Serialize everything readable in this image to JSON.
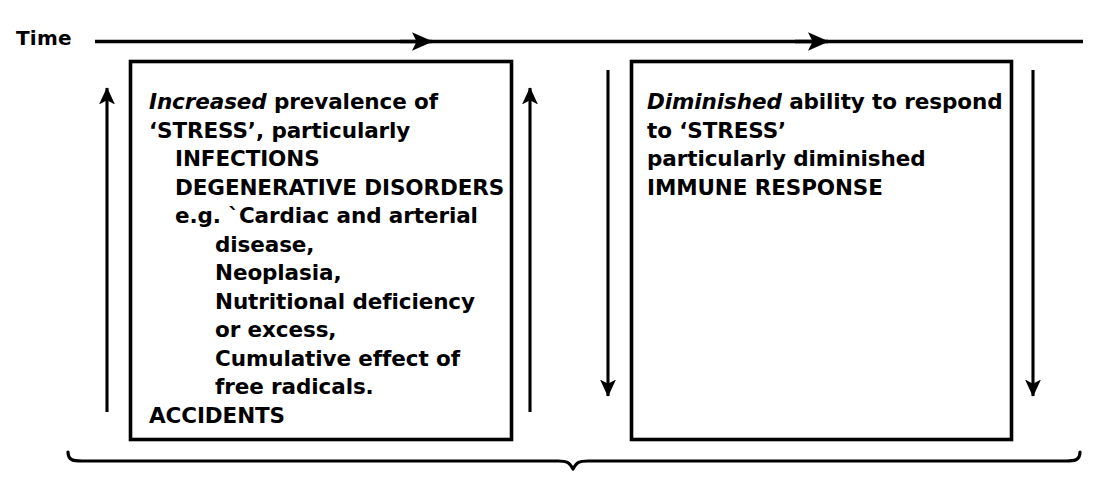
{
  "meta": {
    "diagram_type": "process-flow",
    "width": 1105,
    "height": 478,
    "background_color": "#ffffff",
    "ink_color": "#000000"
  },
  "axis": {
    "label": "Time",
    "direction": "left-to-right",
    "arrowheads": 2
  },
  "boxes": [
    {
      "id": "left-box",
      "lines": [
        {
          "text_italic": "Increased",
          "text": " prevalence of",
          "indent": 0
        },
        {
          "text_italic": "",
          "text": "‘STRESS’, particularly",
          "indent": 0
        },
        {
          "text_italic": "",
          "text": "INFECTIONS",
          "indent": 1
        },
        {
          "text_italic": "",
          "text": "DEGENERATIVE DISORDERS",
          "indent": 1
        },
        {
          "text_italic": "",
          "text": "e.g. `Cardiac and arterial",
          "indent": 1
        },
        {
          "text_italic": "",
          "text": "disease,",
          "indent": 2
        },
        {
          "text_italic": "",
          "text": "Neoplasia,",
          "indent": 2
        },
        {
          "text_italic": "",
          "text": "Nutritional deficiency",
          "indent": 2
        },
        {
          "text_italic": "",
          "text": "or excess,",
          "indent": 2
        },
        {
          "text_italic": "",
          "text": "Cumulative effect of",
          "indent": 2
        },
        {
          "text_italic": "",
          "text": "free radicals.",
          "indent": 2
        },
        {
          "text_italic": "",
          "text": "ACCIDENTS",
          "indent": 0
        }
      ]
    },
    {
      "id": "right-box",
      "lines": [
        {
          "text_italic": "Diminished",
          "text": " ability to respond",
          "indent": 0
        },
        {
          "text_italic": "",
          "text": "to ‘STRESS’",
          "indent": 0
        },
        {
          "text_italic": "",
          "text": "particularly diminished",
          "indent": 0
        },
        {
          "text_italic": "",
          "text": "IMMUNE RESPONSE",
          "indent": 0
        }
      ]
    }
  ],
  "vertical_arrows": [
    {
      "id": "arrow-left-outer",
      "direction": "up",
      "x": 107
    },
    {
      "id": "arrow-left-inner",
      "direction": "up",
      "x": 530
    },
    {
      "id": "arrow-right-inner",
      "direction": "down",
      "x": 608
    },
    {
      "id": "arrow-right-outer",
      "direction": "down",
      "x": 1033
    }
  ],
  "brace": {
    "id": "bottom-brace",
    "orientation": "down",
    "span_start_x": 68,
    "span_end_x": 1080,
    "center_x": 573
  }
}
